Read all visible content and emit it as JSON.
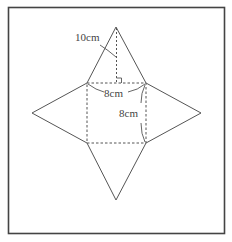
{
  "figure": {
    "type": "square-pyramid-net",
    "labels": {
      "height_label": "10cm",
      "base_width_label": "8cm",
      "base_depth_label": "8cm"
    },
    "measurements": {
      "triangle_height_cm": 10,
      "base_side_cm": 8
    },
    "colors": {
      "line": "#555555",
      "frame": "#444444",
      "background": "#ffffff",
      "text": "#444444"
    }
  }
}
